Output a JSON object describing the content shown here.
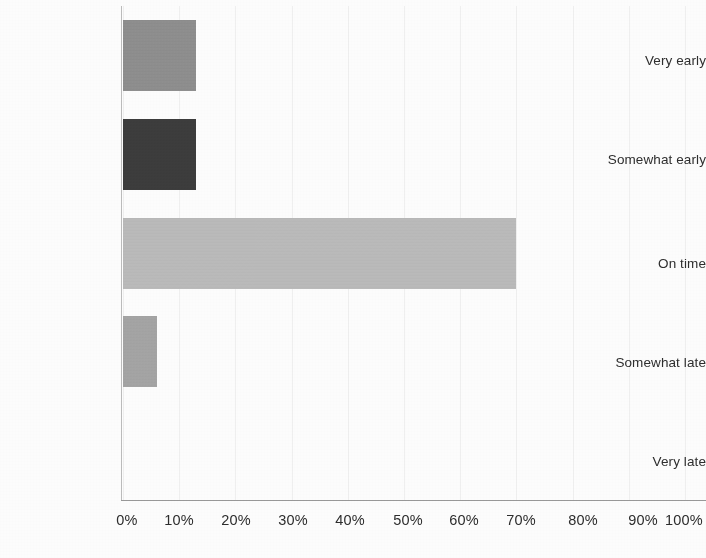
{
  "chart_data": {
    "type": "bar",
    "orientation": "horizontal",
    "title": "",
    "subtitle": "",
    "xlabel": "",
    "ylabel": "",
    "categories": [
      "Very early",
      "Somewhat early",
      "On time",
      "Somewhat late",
      "Very late"
    ],
    "values": [
      13,
      13,
      70,
      6,
      0
    ],
    "value_format": "percent",
    "xlim": [
      0,
      100
    ],
    "xticks": [
      0,
      10,
      20,
      30,
      40,
      50,
      60,
      70,
      80,
      90,
      100
    ],
    "xtick_labels": [
      "0%",
      "10%",
      "20%",
      "30%",
      "40%",
      "50%",
      "60%",
      "70%",
      "80%",
      "90%",
      "100%"
    ],
    "grid": true,
    "grid_axis": "x",
    "legend": false,
    "legend_position": "none",
    "annotations": [],
    "series": [
      {
        "name": "Share of responses",
        "values": [
          13,
          13,
          70,
          6,
          0
        ],
        "bar_colors": [
          "#8b8b8b",
          "#3b3b3b",
          "#b9b9b9",
          "#a2a2a2",
          "#ffffff"
        ]
      }
    ],
    "colors": {
      "very_early": "#8b8b8b",
      "somewhat_early": "#3b3b3b",
      "on_time": "#b9b9b9",
      "somewhat_late": "#a2a2a2",
      "very_late": "#ffffff",
      "axis": "#9a9a9a",
      "gridline": "#f1f1f1",
      "text": "#2e2e2e",
      "background": "#fefefe"
    }
  }
}
